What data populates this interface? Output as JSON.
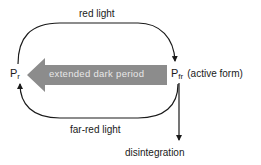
{
  "diagram": {
    "nodes": {
      "pr": {
        "main": "P",
        "sub": "r"
      },
      "pfr": {
        "main": "P",
        "sub": "fr",
        "note": "(active form)"
      }
    },
    "edges": {
      "top": {
        "label": "red light",
        "from": "pr",
        "to": "pfr"
      },
      "bottom": {
        "label": "far-red light",
        "from": "pfr",
        "to": "pr"
      },
      "dark": {
        "label": "extended dark period",
        "from": "pfr",
        "to": "pr"
      },
      "down": {
        "label": "disintegration",
        "from": "pfr"
      }
    },
    "colors": {
      "line": "#1a1a1a",
      "dark_arrow": "#8c8c8c",
      "dark_arrow_text": "#e8e8e8"
    }
  }
}
